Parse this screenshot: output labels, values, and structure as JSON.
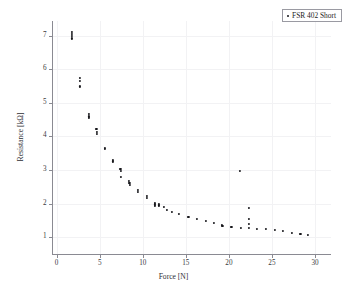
{
  "figure": {
    "width": 347,
    "height": 296,
    "background": "#ffffff",
    "marker_color": "#16161a",
    "axis_color": "#8a8a92",
    "grid_color": "#f2f2f4"
  },
  "legend": {
    "position": "top-right",
    "entries": [
      {
        "label": "FSR 402 Short",
        "marker": "dot",
        "color": "#16161a"
      }
    ]
  },
  "chart_data": {
    "type": "scatter",
    "title": "",
    "subtitle": "",
    "xlabel": "Force [N]",
    "ylabel": "Resistance [kΩ]",
    "xlim": [
      -0.6,
      31.8
    ],
    "ylim": [
      0.52,
      7.45
    ],
    "xticks": [
      0,
      5,
      10,
      15,
      20,
      25,
      30
    ],
    "yticks": [
      1,
      2,
      3,
      4,
      5,
      6,
      7
    ],
    "xtick_labels": [
      "0",
      "5",
      "10",
      "15",
      "20",
      "25",
      "30"
    ],
    "ytick_labels": [
      "1",
      "2",
      "3",
      "4",
      "5",
      "6",
      "7"
    ],
    "grid": true,
    "legend_position": "top-right",
    "series": [
      {
        "name": "FSR 402 Short",
        "color": "#16161a",
        "marker": "dot",
        "points": [
          [
            1.75,
            7.12
          ],
          [
            1.75,
            7.05
          ],
          [
            1.75,
            6.98
          ],
          [
            1.78,
            6.92
          ],
          [
            2.7,
            5.74
          ],
          [
            2.72,
            5.66
          ],
          [
            2.74,
            5.49
          ],
          [
            3.7,
            4.66
          ],
          [
            3.7,
            4.6
          ],
          [
            3.72,
            4.55
          ],
          [
            4.62,
            4.22
          ],
          [
            4.64,
            4.14
          ],
          [
            4.66,
            4.08
          ],
          [
            5.58,
            3.66
          ],
          [
            5.6,
            3.62
          ],
          [
            6.5,
            3.3
          ],
          [
            6.52,
            3.26
          ],
          [
            7.4,
            3.04
          ],
          [
            7.42,
            2.98
          ],
          [
            7.48,
            2.8
          ],
          [
            8.42,
            2.68
          ],
          [
            8.44,
            2.62
          ],
          [
            8.46,
            2.56
          ],
          [
            9.4,
            2.4
          ],
          [
            9.42,
            2.34
          ],
          [
            10.45,
            2.24
          ],
          [
            10.47,
            2.18
          ],
          [
            11.4,
            2.02
          ],
          [
            11.42,
            1.98
          ],
          [
            11.45,
            1.94
          ],
          [
            11.9,
            2.0
          ],
          [
            11.92,
            1.95
          ],
          [
            12.45,
            1.9
          ],
          [
            12.8,
            1.82
          ],
          [
            13.4,
            1.76
          ],
          [
            14.2,
            1.7
          ],
          [
            15.3,
            1.62
          ],
          [
            16.3,
            1.56
          ],
          [
            17.3,
            1.5
          ],
          [
            18.3,
            1.44
          ],
          [
            19.2,
            1.36
          ],
          [
            19.25,
            1.33
          ],
          [
            20.3,
            1.3
          ],
          [
            21.3,
            2.98
          ],
          [
            21.35,
            1.29
          ],
          [
            22.3,
            1.88
          ],
          [
            22.32,
            1.54
          ],
          [
            22.34,
            1.4
          ],
          [
            22.36,
            1.28
          ],
          [
            23.3,
            1.26
          ],
          [
            24.3,
            1.24
          ],
          [
            25.3,
            1.22
          ],
          [
            26.3,
            1.18
          ],
          [
            27.3,
            1.14
          ],
          [
            28.3,
            1.1
          ],
          [
            29.2,
            1.07
          ]
        ]
      }
    ]
  }
}
